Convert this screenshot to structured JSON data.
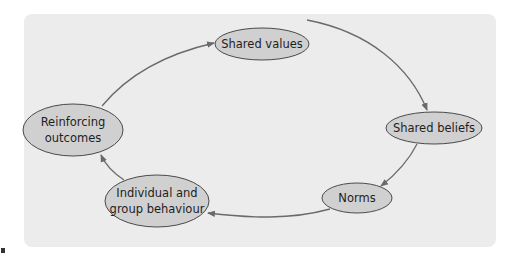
{
  "diagram": {
    "type": "cycle",
    "background_color": "#ececec",
    "node_fill": "#d0d0d0",
    "node_stroke": "#4a4a4a",
    "edge_color": "#6a6a6a",
    "nodes": [
      {
        "id": "shared_values",
        "lines": [
          "Shared values"
        ]
      },
      {
        "id": "shared_beliefs",
        "lines": [
          "Shared beliefs"
        ]
      },
      {
        "id": "norms",
        "lines": [
          "Norms"
        ]
      },
      {
        "id": "individual_group_behaviour",
        "lines": [
          "Individual and",
          "group behaviour"
        ]
      },
      {
        "id": "reinforcing_outcomes",
        "lines": [
          "Reinforcing",
          "outcomes"
        ]
      }
    ],
    "edges": [
      {
        "from": "shared_values",
        "to": "shared_beliefs"
      },
      {
        "from": "shared_beliefs",
        "to": "norms"
      },
      {
        "from": "norms",
        "to": "individual_group_behaviour"
      },
      {
        "from": "individual_group_behaviour",
        "to": "reinforcing_outcomes"
      },
      {
        "from": "reinforcing_outcomes",
        "to": "shared_values"
      }
    ]
  }
}
